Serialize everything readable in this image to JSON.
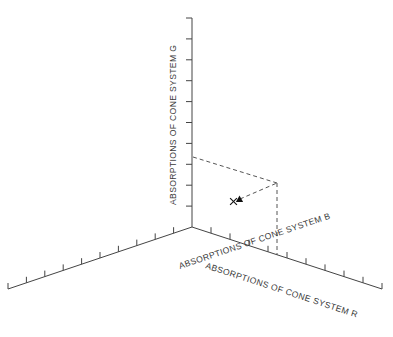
{
  "figure": {
    "name": "cone-system-absorption-axes",
    "background_color": "#ffffff",
    "line_color": "#444444",
    "dash_color": "#555555",
    "marker_color": "#111111",
    "width": 393,
    "height": 337
  },
  "axes": {
    "g": {
      "label": "ABSORPTIONS OF CONE SYSTEM G",
      "orientation": "vertical-up",
      "origin": {
        "x": 192,
        "y": 227
      },
      "end": {
        "x": 192,
        "y": 18
      },
      "tick_count": 10,
      "tick_side": "left",
      "tick_length": 6,
      "label_anchor": {
        "x": 176,
        "y": 205
      },
      "label_rotation": -90
    },
    "r": {
      "label": "ABSORPTIONS OF CONE SYSTEM R",
      "orientation": "down-right",
      "origin": {
        "x": 192,
        "y": 227
      },
      "end": {
        "x": 382,
        "y": 289
      },
      "tick_count": 10,
      "tick_side": "upper",
      "tick_length": 6,
      "label_anchor": {
        "x": 205,
        "y": 268
      },
      "label_rotation": 18.1
    },
    "b": {
      "label": "ABSORPTIONS OF CONE SYSTEM B",
      "orientation": "down-left",
      "origin": {
        "x": 192,
        "y": 227
      },
      "end": {
        "x": 8,
        "y": 289
      },
      "tick_count": 10,
      "tick_side": "upper",
      "tick_length": 6,
      "label_anchor": {
        "x": 180,
        "y": 269
      },
      "label_rotation": -18.6
    }
  },
  "chart_data": {
    "type": "scatter",
    "title": "",
    "subtitle": "",
    "xlabel": "ABSORPTIONS OF CONE SYSTEM R",
    "ylabel": "ABSORPTIONS OF CONE SYSTEM G",
    "zlabel": "ABSORPTIONS OF CONE SYSTEM B",
    "projection": "3d-isometric",
    "grid": false,
    "legend": false,
    "axis_ticks_labeled": false,
    "points": [
      {
        "name": "cross-marker",
        "symbol": "x",
        "px": {
          "x": 233.5,
          "y": 201.5
        }
      },
      {
        "name": "triangle-marker",
        "symbol": "filled-triangle",
        "px": {
          "x": 239.5,
          "y": 199.0
        }
      }
    ],
    "projection_vertex": {
      "x": 277,
      "y": 183
    },
    "projection_lines": [
      {
        "name": "g-axis-to-vertex",
        "from": {
          "x": 193,
          "y": 157
        },
        "to": {
          "x": 277,
          "y": 183
        },
        "style": "dashed"
      },
      {
        "name": "vertex-to-r-axis",
        "from": {
          "x": 277,
          "y": 183
        },
        "to": {
          "x": 277,
          "y": 255
        },
        "style": "dashed"
      },
      {
        "name": "marker-to-vertex",
        "from": {
          "x": 240,
          "y": 199
        },
        "to": {
          "x": 277,
          "y": 183
        },
        "style": "dashed"
      }
    ]
  }
}
